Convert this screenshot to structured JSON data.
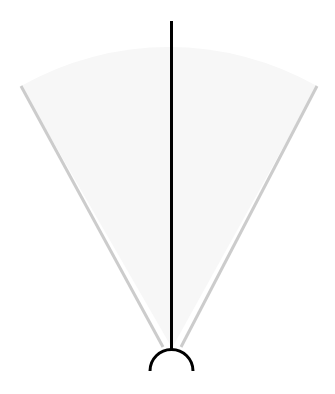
{
  "diagram": {
    "type": "field-of-view",
    "width": 335,
    "height": 394,
    "colors": {
      "background": "#ffffff",
      "heading_line": "#000000",
      "boundary_lines": "#cccccc",
      "sector_fill": "#f7f7f7",
      "sensor": "#000000"
    },
    "sensor": {
      "cx": 171.5,
      "cy": 371,
      "r": 21.5
    },
    "heading_line": {
      "x1": 171.5,
      "y1": 21,
      "x2": 171.5,
      "y2": 349
    },
    "left_boundary": {
      "x1": 163,
      "y1": 347,
      "x2": 21,
      "y2": 86
    },
    "right_boundary": {
      "x1": 181,
      "y1": 347,
      "x2": 317,
      "y2": 86
    }
  }
}
